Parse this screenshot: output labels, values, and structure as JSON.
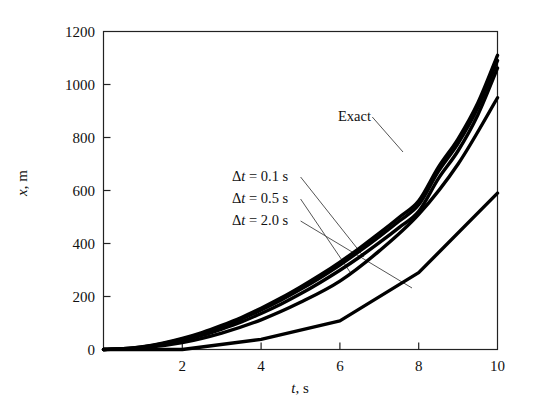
{
  "figure": {
    "background": "#ffffff",
    "ink": "#111111"
  },
  "axes": {
    "x": {
      "title_prefix": "t",
      "title_suffix": ", s",
      "title_full": "t, s",
      "min": 0,
      "max": 10,
      "ticks": [
        2,
        4,
        6,
        8,
        10
      ],
      "tick_labels": [
        "2",
        "4",
        "6",
        "8",
        "10"
      ]
    },
    "y": {
      "title_prefix": "x",
      "title_suffix": ", m",
      "title_full": "x, m",
      "min": 0,
      "max": 1200,
      "ticks": [
        0,
        200,
        400,
        600,
        800,
        1000,
        1200
      ],
      "tick_labels": [
        "0",
        "200",
        "400",
        "600",
        "800",
        "1000",
        "1200"
      ]
    }
  },
  "annotations": [
    {
      "id": "exact",
      "text_full": "Exact",
      "prefix": "",
      "sym": "",
      "rest": "Exact",
      "x_px": 338,
      "y_px": 108,
      "leader_to_x": 403,
      "leader_to_y": 152
    },
    {
      "id": "dt01",
      "text_full": "Δt = 0.1 s",
      "prefix": "Δ",
      "sym": "t",
      "rest": " = 0.1 s",
      "x_px": 232,
      "y_px": 168,
      "leader_to_x": 364,
      "leader_to_y": 257
    },
    {
      "id": "dt05",
      "text_full": "Δt = 0.5 s",
      "prefix": "Δ",
      "sym": "t",
      "rest": " = 0.5 s",
      "x_px": 232,
      "y_px": 190,
      "leader_to_x": 350,
      "leader_to_y": 272
    },
    {
      "id": "dt20",
      "text_full": "Δt = 2.0 s",
      "prefix": "Δ",
      "sym": "t",
      "rest": " = 2.0 s",
      "x_px": 232,
      "y_px": 212,
      "leader_to_x": 412,
      "leader_to_y": 288
    }
  ],
  "chart_data": {
    "type": "line",
    "title": "",
    "subtitle": "",
    "xlabel": "t, s",
    "ylabel": "x, m",
    "xlim": [
      0,
      10
    ],
    "ylim": [
      0,
      1200
    ],
    "grid": false,
    "legend_position": "inline-annotations",
    "x_ticks": [
      2,
      4,
      6,
      8,
      10
    ],
    "y_ticks": [
      0,
      200,
      400,
      600,
      800,
      1000,
      1200
    ],
    "series": [
      {
        "name": "Exact",
        "style": "solid",
        "color": "#000000",
        "x": [
          0,
          0.5,
          1,
          1.5,
          2,
          2.5,
          3,
          3.5,
          4,
          4.5,
          5,
          5.5,
          6,
          6.5,
          7,
          7.5,
          8,
          8.5,
          9,
          9.5,
          10
        ],
        "y": [
          0,
          3,
          11,
          24,
          42,
          64,
          91,
          121,
          156,
          194,
          236,
          281,
          330,
          383,
          439,
          498,
          561,
          688,
          795,
          930,
          1110
        ]
      },
      {
        "name": "Δt = 0.1 s",
        "style": "solid",
        "color": "#000000",
        "x": [
          0,
          0.5,
          1,
          1.5,
          2,
          2.5,
          3,
          3.5,
          4,
          4.5,
          5,
          5.5,
          6,
          6.5,
          7,
          7.5,
          8,
          8.5,
          9,
          9.5,
          10
        ],
        "y": [
          0,
          3,
          10,
          22,
          39,
          60,
          86,
          115,
          149,
          186,
          227,
          271,
          319,
          371,
          426,
          484,
          546,
          672,
          778,
          912,
          1090
        ]
      },
      {
        "name": "Δt = 0.5 s",
        "style": "solid",
        "color": "#000000",
        "x": [
          0,
          0.5,
          1,
          1.5,
          2,
          2.5,
          3,
          3.5,
          4,
          4.5,
          5,
          5.5,
          6,
          6.5,
          7,
          7.5,
          8,
          8.5,
          9,
          9.5,
          10
        ],
        "y": [
          0,
          2,
          8,
          19,
          34,
          53,
          77,
          104,
          136,
          171,
          210,
          253,
          299,
          349,
          403,
          460,
          521,
          645,
          750,
          885,
          1062
        ]
      },
      {
        "name": "intermediate",
        "style": "solid",
        "color": "#000000",
        "x": [
          0,
          1,
          2,
          3,
          4,
          5,
          6,
          7,
          8,
          9,
          10
        ],
        "y": [
          0,
          6,
          26,
          62,
          112,
          178,
          258,
          372,
          510,
          700,
          950
        ]
      },
      {
        "name": "Δt = 2.0 s",
        "style": "solid-piecewise",
        "color": "#000000",
        "x": [
          0,
          2,
          4,
          6,
          8,
          10
        ],
        "y": [
          0,
          0,
          38,
          108,
          290,
          590
        ]
      }
    ]
  }
}
